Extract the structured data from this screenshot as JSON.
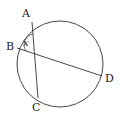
{
  "diagram": {
    "circle": {
      "cx": 60,
      "cy": 64,
      "r": 43
    },
    "points": {
      "A": {
        "label": "A",
        "x": 32,
        "y": 22
      },
      "B": {
        "label": "B",
        "x": 17,
        "y": 48
      },
      "C": {
        "label": "C",
        "x": 38,
        "y": 98
      },
      "D": {
        "label": "D",
        "x": 102,
        "y": 76
      }
    },
    "chords": [
      [
        "A",
        "C"
      ],
      [
        "B",
        "D"
      ]
    ],
    "angle_label": "x",
    "stroke_color": "#333333"
  }
}
